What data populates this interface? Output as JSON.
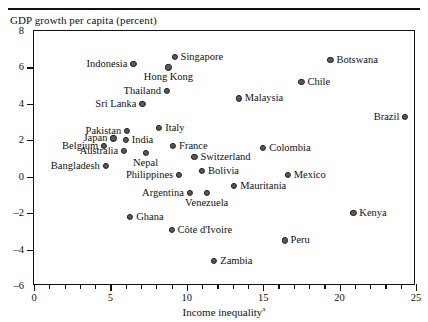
{
  "figure": {
    "ylabel_top": "GDP growth per capita (percent)",
    "xlabel": "Income inequality",
    "xlabel_footnote": "a"
  },
  "chart_data": {
    "type": "scatter",
    "title": "",
    "xlabel": "Income inequality",
    "ylabel": "GDP growth per capita (percent)",
    "xlim": [
      0,
      25
    ],
    "ylim": [
      -6,
      8
    ],
    "xticks": [
      0,
      5,
      10,
      15,
      20,
      25
    ],
    "yticks": [
      8,
      6,
      4,
      2,
      0,
      -2,
      -4,
      -6
    ],
    "grid": false,
    "legend": null,
    "points": [
      {
        "label": "Singapore",
        "x": 9.2,
        "y": 6.6,
        "label_pos": "right"
      },
      {
        "label": "Hong Kong",
        "x": 8.8,
        "y": 6.0,
        "label_pos": "below"
      },
      {
        "label": "Indonesia",
        "x": 6.5,
        "y": 6.2,
        "label_pos": "left"
      },
      {
        "label": "Botswana",
        "x": 19.4,
        "y": 6.4,
        "label_pos": "right"
      },
      {
        "label": "Chile",
        "x": 17.5,
        "y": 5.2,
        "label_pos": "right"
      },
      {
        "label": "Thailand",
        "x": 8.7,
        "y": 4.7,
        "label_pos": "left"
      },
      {
        "label": "Malaysia",
        "x": 13.4,
        "y": 4.3,
        "label_pos": "right"
      },
      {
        "label": "Sri Lanka",
        "x": 7.1,
        "y": 4.0,
        "label_pos": "left"
      },
      {
        "label": "Brazil",
        "x": 24.3,
        "y": 3.3,
        "label_pos": "left"
      },
      {
        "label": "Italy",
        "x": 8.2,
        "y": 2.7,
        "label_pos": "right"
      },
      {
        "label": "Pakistan",
        "x": 6.1,
        "y": 2.5,
        "label_pos": "left"
      },
      {
        "label": "Japan",
        "x": 5.2,
        "y": 2.1,
        "label_pos": "left"
      },
      {
        "label": "India",
        "x": 6.0,
        "y": 2.0,
        "label_pos": "right"
      },
      {
        "label": "Colombia",
        "x": 15.0,
        "y": 1.6,
        "label_pos": "right"
      },
      {
        "label": "Belgium",
        "x": 4.6,
        "y": 1.7,
        "label_pos": "left"
      },
      {
        "label": "France",
        "x": 9.1,
        "y": 1.7,
        "label_pos": "right"
      },
      {
        "label": "Nepal",
        "x": 7.3,
        "y": 1.3,
        "label_pos": "below"
      },
      {
        "label": "Australia",
        "x": 5.9,
        "y": 1.4,
        "label_pos": "left"
      },
      {
        "label": "Switzerland",
        "x": 10.5,
        "y": 1.1,
        "label_pos": "right"
      },
      {
        "label": "Bangladesh",
        "x": 4.7,
        "y": 0.6,
        "label_pos": "left"
      },
      {
        "label": "Bolivia",
        "x": 11.0,
        "y": 0.3,
        "label_pos": "right"
      },
      {
        "label": "Mexico",
        "x": 16.6,
        "y": 0.1,
        "label_pos": "right"
      },
      {
        "label": "Philippines",
        "x": 9.5,
        "y": 0.1,
        "label_pos": "left"
      },
      {
        "label": "Mauritania",
        "x": 13.1,
        "y": -0.5,
        "label_pos": "right"
      },
      {
        "label": "Argentina",
        "x": 10.2,
        "y": -0.9,
        "label_pos": "left"
      },
      {
        "label": "Venezuela",
        "x": 11.3,
        "y": -0.9,
        "label_pos": "below"
      },
      {
        "label": "Kenya",
        "x": 20.9,
        "y": -2.0,
        "label_pos": "right"
      },
      {
        "label": "Ghana",
        "x": 6.3,
        "y": -2.2,
        "label_pos": "right"
      },
      {
        "label": "Côte d'Ivoire",
        "x": 9.0,
        "y": -2.9,
        "label_pos": "right"
      },
      {
        "label": "Peru",
        "x": 16.4,
        "y": -3.5,
        "label_pos": "right"
      },
      {
        "label": "Zambia",
        "x": 11.8,
        "y": -4.6,
        "label_pos": "right"
      }
    ]
  }
}
